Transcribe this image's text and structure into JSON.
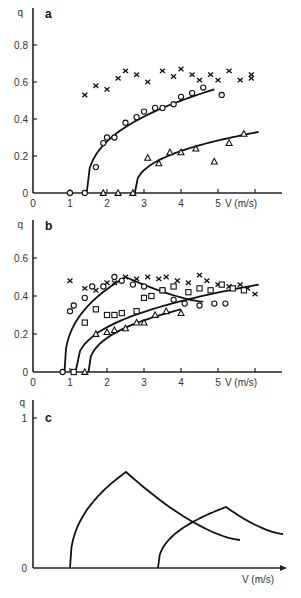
{
  "chart_data": [
    {
      "panel": "a",
      "type": "scatter",
      "title": "a",
      "xlabel": "V (m/s)",
      "ylabel": "q",
      "xlim": [
        0,
        6.5
      ],
      "ylim": [
        0,
        0.85
      ],
      "xticks": [
        "0",
        "1",
        "2",
        "3",
        "4",
        "5"
      ],
      "yticks": [
        "0",
        "0.2",
        "0.4",
        "0.6",
        "0.8"
      ],
      "series": [
        {
          "name": "crosses",
          "marker": "x",
          "x": [
            1.4,
            1.7,
            2.0,
            2.3,
            2.5,
            2.8,
            3.1,
            3.5,
            3.8,
            4.0,
            4.3,
            4.5,
            4.8,
            5.0,
            5.3,
            5.6,
            5.9,
            5.9
          ],
          "y": [
            0.53,
            0.58,
            0.56,
            0.62,
            0.66,
            0.64,
            0.6,
            0.66,
            0.63,
            0.67,
            0.64,
            0.61,
            0.64,
            0.61,
            0.66,
            0.61,
            0.64,
            0.62
          ]
        },
        {
          "name": "circles",
          "marker": "o",
          "x": [
            1.0,
            1.4,
            1.7,
            1.9,
            2.0,
            2.2,
            2.5,
            2.8,
            3.0,
            3.3,
            3.5,
            3.8,
            4.0,
            4.3,
            4.6,
            5.1
          ],
          "y": [
            0,
            0,
            0.14,
            0.27,
            0.3,
            0.3,
            0.38,
            0.41,
            0.44,
            0.46,
            0.46,
            0.48,
            0.52,
            0.54,
            0.57,
            0.53
          ]
        },
        {
          "name": "triangles",
          "marker": "triangle",
          "x": [
            1.9,
            2.3,
            2.7,
            3.1,
            3.4,
            3.7,
            4.0,
            4.4,
            4.9,
            5.3,
            5.7
          ],
          "y": [
            0,
            0,
            0,
            0.19,
            0.16,
            0.22,
            0.22,
            0.24,
            0.17,
            0.27,
            0.32
          ]
        }
      ],
      "fits": [
        {
          "name": "circles-fit",
          "onset": 1.45,
          "end": 4.9,
          "end_value": 0.56
        },
        {
          "name": "triangles-fit",
          "onset": 2.75,
          "end": 6.1,
          "end_value": 0.33
        }
      ]
    },
    {
      "panel": "b",
      "type": "scatter",
      "title": "b",
      "xlabel": "V (m/s)",
      "ylabel": "q",
      "xlim": [
        0,
        6.5
      ],
      "ylim": [
        0,
        0.7
      ],
      "xticks": [
        "0",
        "1",
        "2",
        "3",
        "4",
        "5"
      ],
      "yticks": [
        "0",
        "0.2",
        "0.4",
        "0.6"
      ],
      "series": [
        {
          "name": "crosses",
          "marker": "x",
          "x": [
            1.0,
            1.4,
            1.7,
            2.0,
            2.2,
            2.5,
            2.8,
            3.1,
            3.4,
            3.6,
            3.9,
            4.2,
            4.5,
            4.7,
            5.0,
            5.3,
            5.6,
            5.8,
            6.0
          ],
          "y": [
            0.48,
            0.44,
            0.43,
            0.47,
            0.47,
            0.5,
            0.49,
            0.5,
            0.49,
            0.5,
            0.48,
            0.47,
            0.51,
            0.48,
            0.46,
            0.45,
            0.46,
            0.44,
            0.41
          ]
        },
        {
          "name": "circles",
          "marker": "o",
          "x": [
            0.8,
            1.0,
            1.1,
            1.4,
            1.6,
            1.9,
            2.2,
            2.4,
            2.7,
            3.0,
            3.5,
            3.8,
            4.1,
            4.5,
            4.9,
            5.2
          ],
          "y": [
            0,
            0.32,
            0.35,
            0.39,
            0.45,
            0.45,
            0.5,
            0.48,
            0.46,
            0.45,
            0.43,
            0.38,
            0.36,
            0.35,
            0.36,
            0.36
          ]
        },
        {
          "name": "squares",
          "marker": "square",
          "x": [
            1.1,
            1.4,
            1.7,
            2.0,
            2.2,
            2.4,
            2.8,
            3.0,
            3.2,
            3.5,
            3.8,
            4.2,
            4.5,
            4.8,
            5.1,
            5.4,
            5.7
          ],
          "y": [
            0,
            0.26,
            0.33,
            0.3,
            0.3,
            0.31,
            0.32,
            0.39,
            0.4,
            0.43,
            0.45,
            0.42,
            0.44,
            0.43,
            0.46,
            0.44,
            0.43
          ]
        },
        {
          "name": "triangles",
          "marker": "triangle",
          "x": [
            1.4,
            1.7,
            2.0,
            2.2,
            2.5,
            2.8,
            3.0,
            3.3,
            3.6,
            4.0
          ],
          "y": [
            0,
            0.2,
            0.21,
            0.22,
            0.23,
            0.26,
            0.26,
            0.3,
            0.32,
            0.31
          ]
        }
      ],
      "fits": [
        {
          "name": "circles-fit",
          "onset": 0.85,
          "peak_x": 2.5,
          "peak_y": 0.5,
          "end": 4.6,
          "end_value": 0.37
        },
        {
          "name": "squares-fit",
          "onset": 1.15,
          "end": 6.1,
          "end_value": 0.46
        },
        {
          "name": "triangles-fit",
          "onset": 1.5,
          "end": 4.0,
          "end_value": 0.33
        }
      ]
    },
    {
      "panel": "c",
      "type": "line",
      "title": "c",
      "xlabel": "V (m/s)",
      "ylabel": "q",
      "ylim": [
        0,
        1
      ],
      "yticks": [
        "0",
        "1"
      ],
      "series": [
        {
          "name": "curve-1",
          "onset_px": 70,
          "peak_px": [
            126,
            472
          ],
          "end_px": [
            240,
            540
          ]
        },
        {
          "name": "curve-2",
          "onset_px": 158,
          "peak_px": [
            226,
            507
          ],
          "end_px": [
            283,
            534
          ]
        }
      ]
    }
  ],
  "panels": {
    "a": {
      "label": "a",
      "q_label": "q",
      "v_label": "V (m/s)"
    },
    "b": {
      "label": "b",
      "q_label": "q",
      "v_label": "V (m/s)"
    },
    "c": {
      "label": "c",
      "q_label": "q",
      "v_label": "V (m/s)",
      "ytick_top": "1",
      "ytick_zero": "0"
    }
  }
}
